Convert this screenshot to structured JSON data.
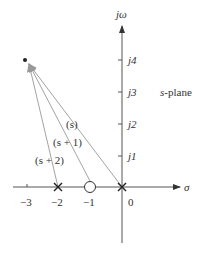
{
  "diagram": {
    "type": "pole-zero s-plane vector diagram",
    "plane_label": "s-plane",
    "axes": {
      "imag_label": "jω",
      "real_label": "σ",
      "imag_ticks": [
        "j1",
        "j2",
        "j3",
        "j4"
      ],
      "real_ticks": [
        "−3",
        "−2",
        "−1",
        "0"
      ]
    },
    "poles": [
      {
        "label": "×",
        "at": "0"
      },
      {
        "label": "×",
        "at": "−2"
      }
    ],
    "zeros": [
      {
        "label": "○",
        "at": "−1"
      }
    ],
    "test_point": "−3 + j4",
    "vectors": [
      {
        "label": "(s)",
        "from": "0"
      },
      {
        "label": "(s + 1)",
        "from": "−1"
      },
      {
        "label": "(s + 2)",
        "from": "−2"
      }
    ],
    "colors": {
      "axis": "#555555",
      "vector": "#8a8a8a",
      "text": "#333333"
    }
  }
}
